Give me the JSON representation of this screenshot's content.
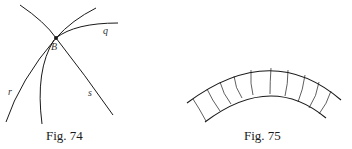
{
  "figures": [
    {
      "caption": "Fig. 74",
      "labels": {
        "point": "B",
        "curve_q": "q",
        "curve_r": "r",
        "curve_s": "s"
      }
    },
    {
      "caption": "Fig. 75"
    }
  ],
  "colors": {
    "stroke": "#1a1a1a",
    "background": "#ffffff"
  }
}
